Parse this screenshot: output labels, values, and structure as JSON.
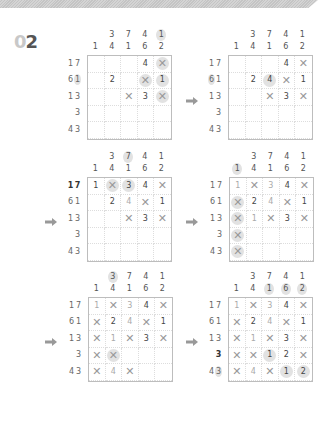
{
  "header": {
    "number_prefix": "0",
    "number": "2"
  },
  "arrow_icon": "right-arrow",
  "puzzles": [
    {
      "col_clues": [
        [
          "",
          "1"
        ],
        [
          "3",
          "4"
        ],
        [
          "7",
          "1"
        ],
        [
          "4",
          "6"
        ],
        [
          "1",
          "2"
        ]
      ],
      "col_hl": [
        [
          0,
          0
        ],
        [
          0,
          0
        ],
        [
          0,
          0
        ],
        [
          0,
          0
        ],
        [
          1,
          0
        ]
      ],
      "row_clues": [
        [
          "1",
          "7"
        ],
        [
          "6",
          "1"
        ],
        [
          "1",
          "3"
        ],
        [
          "",
          "3"
        ],
        [
          "4",
          "3"
        ]
      ],
      "row_hl": [
        [
          0,
          0
        ],
        [
          0,
          1
        ],
        [
          0,
          0
        ],
        [
          0,
          0
        ],
        [
          0,
          0
        ]
      ],
      "row_bold": [
        0,
        0,
        0,
        0,
        0
      ],
      "cells": [
        [
          "",
          "",
          "",
          "4",
          "X*"
        ],
        [
          "",
          "2",
          "",
          "X*",
          "1*"
        ],
        [
          "",
          "",
          "X",
          "3",
          "X*"
        ],
        [
          "",
          "",
          "",
          "",
          ""
        ],
        [
          "",
          "",
          "",
          "",
          ""
        ]
      ]
    },
    {
      "col_clues": [
        [
          "",
          "1"
        ],
        [
          "3",
          "4"
        ],
        [
          "7",
          "1"
        ],
        [
          "4",
          "6"
        ],
        [
          "1",
          "2"
        ]
      ],
      "col_hl": [
        [
          0,
          0
        ],
        [
          0,
          0
        ],
        [
          0,
          0
        ],
        [
          0,
          0
        ],
        [
          0,
          0
        ]
      ],
      "row_clues": [
        [
          "1",
          "7"
        ],
        [
          "6",
          "1"
        ],
        [
          "1",
          "3"
        ],
        [
          "",
          "3"
        ],
        [
          "4",
          "3"
        ]
      ],
      "row_hl": [
        [
          0,
          0
        ],
        [
          1,
          0
        ],
        [
          0,
          0
        ],
        [
          0,
          0
        ],
        [
          0,
          0
        ]
      ],
      "row_bold": [
        0,
        0,
        0,
        0,
        0
      ],
      "cells": [
        [
          "",
          "",
          "",
          "4",
          "X"
        ],
        [
          "",
          "2",
          "4*",
          "X",
          "1"
        ],
        [
          "",
          "",
          "X",
          "3",
          "X"
        ],
        [
          "",
          "",
          "",
          "",
          ""
        ],
        [
          "",
          "",
          "",
          "",
          ""
        ]
      ]
    },
    {
      "col_clues": [
        [
          "",
          "1"
        ],
        [
          "3",
          "4"
        ],
        [
          "7",
          "1"
        ],
        [
          "4",
          "6"
        ],
        [
          "1",
          "2"
        ]
      ],
      "col_hl": [
        [
          0,
          0
        ],
        [
          0,
          0
        ],
        [
          1,
          0
        ],
        [
          0,
          0
        ],
        [
          0,
          0
        ]
      ],
      "row_clues": [
        [
          "1",
          "7"
        ],
        [
          "6",
          "1"
        ],
        [
          "1",
          "3"
        ],
        [
          "",
          "3"
        ],
        [
          "4",
          "3"
        ]
      ],
      "row_hl": [
        [
          0,
          0
        ],
        [
          0,
          0
        ],
        [
          0,
          0
        ],
        [
          0,
          0
        ],
        [
          0,
          0
        ]
      ],
      "row_bold": [
        1,
        0,
        0,
        0,
        0
      ],
      "cells": [
        [
          "1",
          "X*",
          "3*",
          "4",
          "X"
        ],
        [
          "",
          "2",
          "4~",
          "X",
          "1"
        ],
        [
          "",
          "",
          "X",
          "3",
          "X"
        ],
        [
          "",
          "",
          "",
          "",
          ""
        ],
        [
          "",
          "",
          "",
          "",
          ""
        ]
      ]
    },
    {
      "col_clues": [
        [
          "",
          "1"
        ],
        [
          "3",
          "4"
        ],
        [
          "7",
          "1"
        ],
        [
          "4",
          "6"
        ],
        [
          "1",
          "2"
        ]
      ],
      "col_hl": [
        [
          0,
          1
        ],
        [
          0,
          0
        ],
        [
          0,
          0
        ],
        [
          0,
          0
        ],
        [
          0,
          0
        ]
      ],
      "row_clues": [
        [
          "1",
          "7"
        ],
        [
          "6",
          "1"
        ],
        [
          "1",
          "3"
        ],
        [
          "",
          "3"
        ],
        [
          "4",
          "3"
        ]
      ],
      "row_hl": [
        [
          0,
          0
        ],
        [
          0,
          0
        ],
        [
          0,
          0
        ],
        [
          0,
          0
        ],
        [
          0,
          0
        ]
      ],
      "row_bold": [
        0,
        0,
        0,
        0,
        0
      ],
      "cells": [
        [
          "1~",
          "X",
          "3~",
          "4",
          "X"
        ],
        [
          "X*",
          "2",
          "4~",
          "X",
          "1"
        ],
        [
          "X*",
          "1~",
          "X",
          "3",
          "X"
        ],
        [
          "X*",
          "",
          "",
          "",
          ""
        ],
        [
          "X*",
          "",
          "",
          "",
          ""
        ]
      ]
    },
    {
      "col_clues": [
        [
          "",
          "1"
        ],
        [
          "3",
          "4"
        ],
        [
          "7",
          "1"
        ],
        [
          "4",
          "6"
        ],
        [
          "1",
          "2"
        ]
      ],
      "col_hl": [
        [
          0,
          0
        ],
        [
          1,
          0
        ],
        [
          0,
          0
        ],
        [
          0,
          0
        ],
        [
          0,
          0
        ]
      ],
      "row_clues": [
        [
          "1",
          "7"
        ],
        [
          "6",
          "1"
        ],
        [
          "1",
          "3"
        ],
        [
          "",
          "3"
        ],
        [
          "4",
          "3"
        ]
      ],
      "row_hl": [
        [
          0,
          0
        ],
        [
          0,
          0
        ],
        [
          0,
          0
        ],
        [
          0,
          0
        ],
        [
          0,
          0
        ]
      ],
      "row_bold": [
        0,
        0,
        0,
        0,
        0
      ],
      "cells": [
        [
          "1~",
          "X",
          "3~",
          "4",
          "X"
        ],
        [
          "X",
          "2",
          "4~",
          "X",
          "1"
        ],
        [
          "X",
          "1~",
          "X",
          "3",
          "X"
        ],
        [
          "X",
          "X*",
          "",
          "",
          ""
        ],
        [
          "X",
          "4~",
          "X",
          "",
          ""
        ]
      ]
    },
    {
      "col_clues": [
        [
          "",
          "1"
        ],
        [
          "3",
          "4"
        ],
        [
          "7",
          "1"
        ],
        [
          "4",
          "6"
        ],
        [
          "1",
          "2"
        ]
      ],
      "col_hl": [
        [
          0,
          0
        ],
        [
          0,
          0
        ],
        [
          0,
          1
        ],
        [
          0,
          1
        ],
        [
          0,
          1
        ]
      ],
      "row_clues": [
        [
          "1",
          "7"
        ],
        [
          "6",
          "1"
        ],
        [
          "1",
          "3"
        ],
        [
          "",
          "3"
        ],
        [
          "4",
          "3"
        ]
      ],
      "row_hl": [
        [
          0,
          0
        ],
        [
          0,
          0
        ],
        [
          0,
          0
        ],
        [
          0,
          0
        ],
        [
          0,
          1
        ]
      ],
      "row_bold": [
        0,
        0,
        0,
        1,
        0
      ],
      "cells": [
        [
          "1~",
          "X",
          "3~",
          "4",
          "X"
        ],
        [
          "X",
          "2",
          "4~",
          "X",
          "1"
        ],
        [
          "X",
          "1~",
          "X",
          "3",
          "X"
        ],
        [
          "X",
          "X",
          "1*",
          "2",
          "X"
        ],
        [
          "X",
          "4~",
          "X",
          "1*",
          "2*"
        ]
      ]
    }
  ]
}
